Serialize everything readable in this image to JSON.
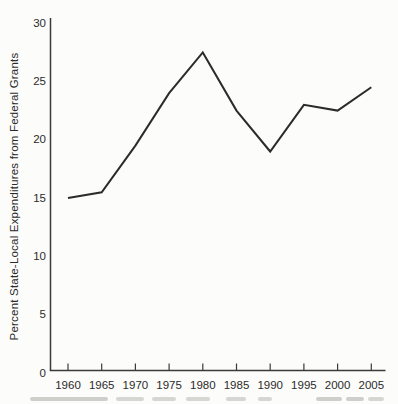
{
  "chart_data": {
    "type": "line",
    "title": "",
    "xlabel": "",
    "ylabel": "Percent State-Local Expenditures from Federal Grants",
    "categories": [
      1960,
      1965,
      1970,
      1975,
      1980,
      1985,
      1990,
      1995,
      2000,
      2005
    ],
    "values": [
      15.0,
      15.5,
      19.5,
      24.0,
      27.5,
      22.5,
      19.0,
      23.0,
      22.5,
      24.5
    ],
    "x_tick_labels": [
      "1960",
      "1965",
      "1970",
      "1975",
      "1980",
      "1985",
      "1990",
      "1995",
      "2000",
      "2005"
    ],
    "y_tick_labels": [
      "0",
      "5",
      "10",
      "15",
      "20",
      "25",
      "30"
    ],
    "yticks": [
      0,
      5,
      10,
      15,
      20,
      25,
      30
    ],
    "ylim": [
      0,
      30
    ],
    "grid": false,
    "legend": false,
    "line_color": "#2b2b2b",
    "axis_color": "#3a3a3a",
    "background_color": "#fcfcfa"
  }
}
